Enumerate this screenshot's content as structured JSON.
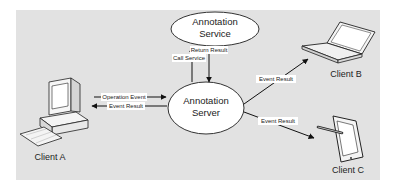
{
  "diagram": {
    "background_color": "#e2e2e2",
    "nodes": {
      "service": {
        "line1": "Annotation",
        "line2": "Service"
      },
      "server": {
        "line1": "Annotation",
        "line2": "Server"
      },
      "client_a": {
        "label": "Client A",
        "device": "desktop-computer"
      },
      "client_b": {
        "label": "Client B",
        "device": "laptop"
      },
      "client_c": {
        "label": "Client C",
        "device": "tablet-with-stylus"
      }
    },
    "edges": {
      "call_service": "Call Service",
      "return_result": "Return Result",
      "operation_event": "Operation Event",
      "event_result_a": "Event Result",
      "event_result_b": "Event Result",
      "event_result_c": "Event Result"
    }
  }
}
